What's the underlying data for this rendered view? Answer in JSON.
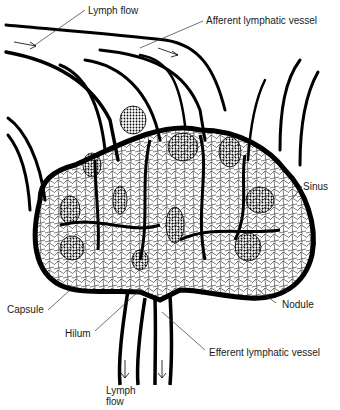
{
  "diagram": {
    "labels": {
      "lymph_flow_top": "Lymph flow",
      "afferent": "Afferent lymphatic vessel",
      "sinus": "Sinus",
      "capsule": "Capsule",
      "nodule": "Nodule",
      "hilum": "Hilum",
      "efferent": "Efferent lymphatic vessel",
      "lymph_flow_bottom_1": "Lymph",
      "lymph_flow_bottom_2": "flow"
    },
    "colors": {
      "ink": "#000000",
      "background": "#ffffff",
      "text": "#1a1a1a"
    }
  }
}
